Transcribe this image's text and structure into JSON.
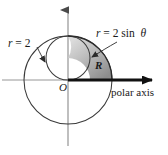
{
  "figure": {
    "origin_label": "O",
    "region_label": "R",
    "axis_label": "polar axis",
    "outer_circle_label": {
      "variable": "r",
      "equals": "=",
      "value": "2",
      "full": "r = 2"
    },
    "inner_circle_label": {
      "variable": "r",
      "equals": "=",
      "coefficient": "2",
      "function": "sin",
      "angle": "θ",
      "full": "r = 2 sin θ"
    },
    "colors": {
      "stroke": "#3a3a3a",
      "axis": "#6b6b6b",
      "bold_axis": "#111111",
      "shade_light": "#d2d2d2",
      "shade_mid": "#b0b0b0",
      "shade_dark": "#8e8e8e",
      "text": "#1a1a1a",
      "background": "#ffffff"
    },
    "geometry": {
      "origin_x": 68,
      "origin_y": 80,
      "outer_radius": 44,
      "inner_center_y": 58,
      "inner_radius": 22
    }
  }
}
